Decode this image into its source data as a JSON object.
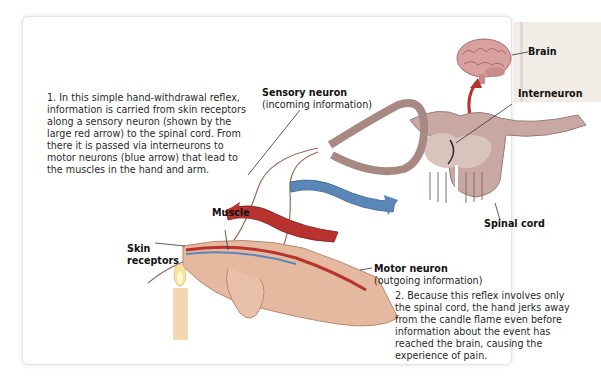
{
  "figure": {
    "caption_1": "1. In this simple hand-withdrawal reflex, information is carried from skin receptors along a sensory neuron (shown by the large red arrow) to the spinal cord. From there it is passed via interneurons to motor neurons (blue arrow) that lead to the muscles in the hand and arm.",
    "caption_2": "2. Because this reflex involves only the spinal cord, the hand jerks away from the candle flame even before information about the event has reached the brain, causing the experience of pain."
  },
  "labels": {
    "brain": "Brain",
    "interneuron": "Interneuron",
    "sensory_neuron": "Sensory neuron",
    "sensory_neuron_sub": "(incoming information)",
    "spinal_cord": "Spinal cord",
    "muscle": "Muscle",
    "skin_receptors_1": "Skin",
    "skin_receptors_2": "receptors",
    "motor_neuron": "Motor neuron",
    "motor_neuron_sub": "(outgoing information)"
  },
  "colors": {
    "sensory_arrow": "#b8322e",
    "motor_arrow": "#5b86b8",
    "spinal_tissue": "#c9a8a3",
    "gray_matter": "#d9c3bd",
    "hand": "#e4b9a0",
    "candle": "#f2d7b3",
    "flame": "#f7e3a0",
    "brain": "#d9a0a0"
  }
}
